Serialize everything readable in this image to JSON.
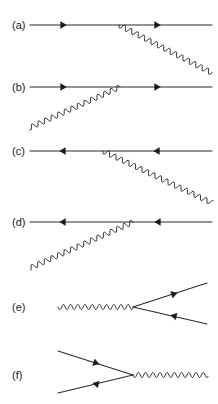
{
  "figure": {
    "kind": "feynman-diagram-set",
    "width": 218,
    "height": 404,
    "background_color": "#ffffff",
    "line_color": "#2b2b2b",
    "label_color": "#1a1a1a",
    "panels": [
      {
        "id": "a",
        "label": "(a)",
        "label_x": 12,
        "label_y": 29,
        "description": "fermion line travelling right with photon emitted down-right from vertex",
        "fermion": {
          "x1": 30,
          "y1": 25,
          "x2": 212,
          "y2": 25,
          "direction": "right"
        },
        "vertex": {
          "x": 119,
          "y": 25
        },
        "boson": {
          "x1": 119,
          "y1": 25,
          "x2": 212,
          "y2": 73
        },
        "arrows": [
          {
            "x": 63,
            "y": 25,
            "angle": 0
          },
          {
            "x": 157,
            "y": 25,
            "angle": 0
          }
        ]
      },
      {
        "id": "b",
        "label": "(b)",
        "label_x": 12,
        "label_y": 91,
        "description": "fermion line travelling right with photon absorbed from lower left at vertex",
        "fermion": {
          "x1": 30,
          "y1": 87,
          "x2": 212,
          "y2": 87,
          "direction": "right"
        },
        "vertex": {
          "x": 120,
          "y": 87
        },
        "boson": {
          "x1": 120,
          "y1": 87,
          "x2": 29,
          "y2": 128
        },
        "arrows": [
          {
            "x": 63,
            "y": 87,
            "angle": 0
          },
          {
            "x": 157,
            "y": 87,
            "angle": 0
          }
        ]
      },
      {
        "id": "c",
        "label": "(c)",
        "label_x": 12,
        "label_y": 155,
        "description": "antifermion line travelling left with photon emitted down-right from vertex",
        "fermion": {
          "x1": 30,
          "y1": 151,
          "x2": 212,
          "y2": 151,
          "direction": "left"
        },
        "vertex": {
          "x": 103,
          "y": 151
        },
        "boson": {
          "x1": 103,
          "y1": 151,
          "x2": 212,
          "y2": 203
        },
        "arrows": [
          {
            "x": 63,
            "y": 151,
            "angle": 180
          },
          {
            "x": 157,
            "y": 151,
            "angle": 180
          }
        ]
      },
      {
        "id": "d",
        "label": "(d)",
        "label_x": 12,
        "label_y": 226,
        "description": "antifermion line travelling left with photon absorbed from lower left at vertex",
        "fermion": {
          "x1": 30,
          "y1": 222,
          "x2": 212,
          "y2": 222,
          "direction": "left"
        },
        "vertex": {
          "x": 133,
          "y": 222
        },
        "boson": {
          "x1": 133,
          "y1": 222,
          "x2": 30,
          "y2": 268
        },
        "arrows": [
          {
            "x": 63,
            "y": 222,
            "angle": 180
          },
          {
            "x": 158,
            "y": 222,
            "angle": 180
          }
        ]
      },
      {
        "id": "e",
        "label": "(e)",
        "label_x": 12,
        "label_y": 311,
        "description": "photon converting into a fermion antifermion pair",
        "vertex": {
          "x": 133,
          "y": 307
        },
        "boson": {
          "x1": 58,
          "y1": 307,
          "x2": 133,
          "y2": 307
        },
        "legs": [
          {
            "x1": 133,
            "y1": 307,
            "x2": 207,
            "y2": 283,
            "arrow_x": 174,
            "arrow_y": 294,
            "arrow_angle": -18
          },
          {
            "x1": 133,
            "y1": 307,
            "x2": 207,
            "y2": 324,
            "arrow_x": 174,
            "arrow_y": 316,
            "arrow_angle": 193
          }
        ]
      },
      {
        "id": "f",
        "label": "(f)",
        "label_x": 12,
        "label_y": 379,
        "description": "fermion antifermion pair annihilating into a photon",
        "vertex": {
          "x": 133,
          "y": 375
        },
        "boson": {
          "x1": 133,
          "y1": 375,
          "x2": 208,
          "y2": 375
        },
        "legs": [
          {
            "x1": 58,
            "y1": 351,
            "x2": 133,
            "y2": 375,
            "arrow_x": 96,
            "arrow_y": 363,
            "arrow_angle": 18
          },
          {
            "x1": 58,
            "y1": 393,
            "x2": 133,
            "y2": 375,
            "arrow_x": 96,
            "arrow_y": 384,
            "arrow_angle": 193
          }
        ]
      }
    ]
  }
}
